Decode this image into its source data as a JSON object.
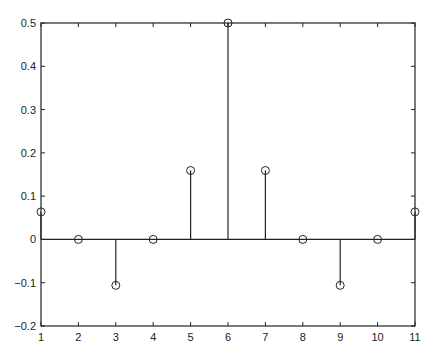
{
  "chart_data": {
    "type": "stem",
    "title": "",
    "xlabel": "",
    "ylabel": "",
    "x": [
      1,
      2,
      3,
      4,
      5,
      6,
      7,
      8,
      9,
      10,
      11
    ],
    "values": [
      0.0637,
      0,
      -0.1061,
      0,
      0.1592,
      0.5,
      0.1592,
      0,
      -0.1061,
      0,
      0.0637
    ],
    "xlim": [
      1,
      11
    ],
    "ylim": [
      -0.2,
      0.5
    ],
    "xticks": [
      "1",
      "2",
      "3",
      "4",
      "5",
      "6",
      "7",
      "8",
      "9",
      "10",
      "11"
    ],
    "yticks": [
      "-0.2",
      "-0.1",
      "0",
      "0.1",
      "0.2",
      "0.3",
      "0.4",
      "0.5"
    ],
    "marker": "circle-open",
    "grid": false,
    "baseline": 0,
    "color": "#222222"
  }
}
